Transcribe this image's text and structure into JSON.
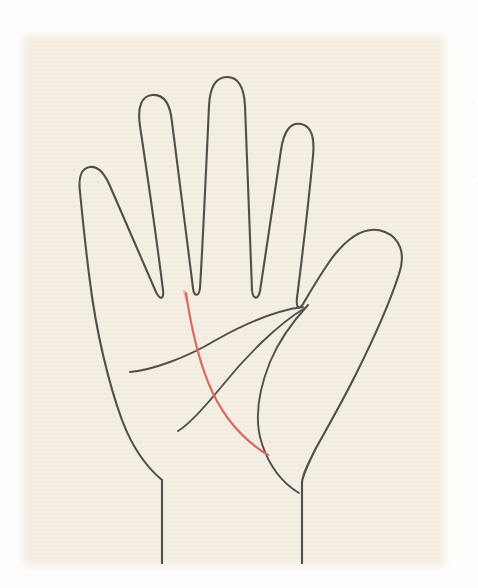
{
  "figure": {
    "background_color": "#fefdfb",
    "paper_color": "#f4eee4",
    "ink_color": "#514f4b",
    "highlight_color": "#d9695e",
    "canvas": {
      "width": 478,
      "height": 588
    }
  },
  "paper": {
    "x": 28,
    "y": 40,
    "width": 412,
    "height": 521
  },
  "hand": {
    "outline_name": "hand-outline",
    "digits": [
      {
        "name": "pinky-finger",
        "position": "leftmost"
      },
      {
        "name": "ring-finger",
        "position": "second-from-left"
      },
      {
        "name": "middle-finger",
        "position": "center-tallest"
      },
      {
        "name": "index-finger",
        "position": "second-from-right"
      },
      {
        "name": "thumb",
        "position": "rightmost"
      }
    ],
    "wrist": {
      "name": "wrist",
      "left_edge_line": "wrist-left-line",
      "right_edge_line": "wrist-right-line"
    }
  },
  "palm_lines": [
    {
      "id": "heart-line",
      "label": "Heart line",
      "color": "#514f4b",
      "style": "solid",
      "description": "upper transverse crease running from the outer palm edge up toward the index-thumb web"
    },
    {
      "id": "head-line",
      "label": "Head line",
      "color": "#514f4b",
      "style": "solid",
      "description": "middle diagonal crease sweeping from the thumb web down to the lower palm"
    },
    {
      "id": "life-line",
      "label": "Life line",
      "color": "#514f4b",
      "style": "solid",
      "description": "arc curving around the base of the thumb enclosing the thenar mount"
    },
    {
      "id": "fate-line",
      "label": "Fate line",
      "color": "#d9695e",
      "style": "highlighted",
      "description": "red highlighted line descending from below the middle finger across the palm to the life line"
    }
  ],
  "margin_marks": {
    "name": "scan-margin-artifacts",
    "visible": true,
    "flecks": [
      "·",
      "-",
      "·",
      "»",
      "·",
      "-",
      "·",
      "«",
      "·",
      "-",
      "·",
      "-"
    ]
  }
}
